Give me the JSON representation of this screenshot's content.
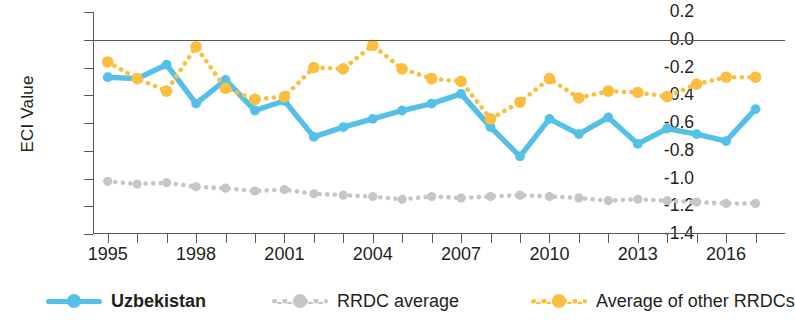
{
  "chart_data": {
    "type": "line",
    "title": "",
    "xlabel": "",
    "ylabel": "ECI Value",
    "xlim": [
      1994.5,
      2018.0
    ],
    "ylim": [
      -1.4,
      0.2
    ],
    "ytick_labels": [
      "0.2",
      "0.0",
      "-0.2",
      "-0.4",
      "-0.6",
      "-0.8",
      "-1.0",
      "-1.2",
      "-1.4"
    ],
    "ytick_values": [
      0.2,
      0.0,
      -0.2,
      -0.4,
      -0.6,
      -0.8,
      -1.0,
      -1.2,
      -1.4
    ],
    "xtick_values": [
      1995,
      1996,
      1997,
      1998,
      1999,
      2000,
      2001,
      2002,
      2003,
      2004,
      2005,
      2006,
      2007,
      2008,
      2009,
      2010,
      2011,
      2012,
      2013,
      2014,
      2015,
      2016,
      2017
    ],
    "xtick_labels": [
      "1995",
      "",
      "",
      "1998",
      "",
      "",
      "2001",
      "",
      "",
      "2004",
      "",
      "",
      "2007",
      "",
      "",
      "2010",
      "",
      "",
      "2013",
      "",
      "",
      "2016",
      ""
    ],
    "grid": false,
    "zero_line": true,
    "legend_position": "bottom",
    "colors": {
      "uzbekistan": "#54c0e8",
      "rrdc_average": "#c6c6c6",
      "other_rrdcs": "#fbbe3f",
      "axis": "#58585b",
      "text": "#231f20"
    },
    "x": [
      1995,
      1996,
      1997,
      1998,
      1999,
      2000,
      2001,
      2002,
      2003,
      2004,
      2005,
      2006,
      2007,
      2008,
      2009,
      2010,
      2011,
      2012,
      2013,
      2014,
      2015,
      2016,
      2017
    ],
    "series": [
      {
        "name": "Uzbekistan",
        "style": "solid",
        "color": "#54c0e8",
        "values": [
          -0.27,
          -0.28,
          -0.18,
          -0.46,
          -0.29,
          -0.51,
          -0.44,
          -0.7,
          -0.63,
          -0.57,
          -0.51,
          -0.46,
          -0.39,
          -0.63,
          -0.84,
          -0.57,
          -0.68,
          -0.56,
          -0.75,
          -0.64,
          -0.68,
          -0.73,
          -0.5
        ]
      },
      {
        "name": "RRDC average",
        "style": "dotted",
        "color": "#c6c6c6",
        "values": [
          -1.02,
          -1.04,
          -1.03,
          -1.06,
          -1.07,
          -1.09,
          -1.08,
          -1.11,
          -1.12,
          -1.13,
          -1.15,
          -1.13,
          -1.14,
          -1.13,
          -1.12,
          -1.13,
          -1.14,
          -1.16,
          -1.15,
          -1.16,
          -1.17,
          -1.18,
          -1.18
        ]
      },
      {
        "name": "Average of other RRDCs",
        "style": "dotted",
        "color": "#fbbe3f",
        "values": [
          -0.16,
          -0.28,
          -0.37,
          -0.05,
          -0.35,
          -0.43,
          -0.41,
          -0.2,
          -0.21,
          -0.04,
          -0.21,
          -0.28,
          -0.3,
          -0.57,
          -0.45,
          -0.28,
          -0.42,
          -0.37,
          -0.38,
          -0.41,
          -0.32,
          -0.27,
          -0.27
        ]
      }
    ]
  },
  "axis": {
    "y_title": "ECI Value"
  },
  "legend": {
    "items": [
      {
        "label": "Uzbekistan",
        "marker": "line-circle-solid",
        "color": "#54c0e8",
        "bold": true
      },
      {
        "label": "RRDC average",
        "marker": "dotted-circle",
        "color": "#c6c6c6",
        "bold": false
      },
      {
        "label": "Average of other RRDCs",
        "marker": "dotted-circle",
        "color": "#fbbe3f",
        "bold": false
      }
    ]
  }
}
